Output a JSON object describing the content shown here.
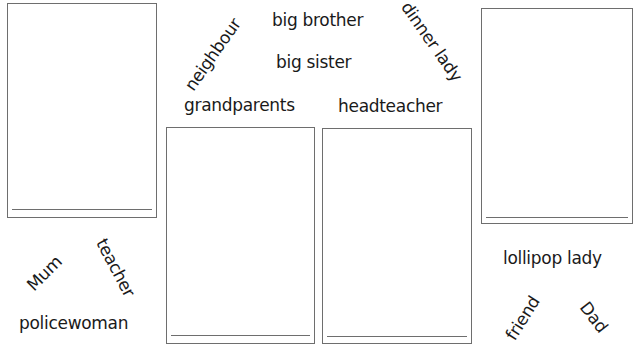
{
  "words": {
    "neighbour": "neighbour",
    "big_brother": "big brother",
    "big_sister": "big sister",
    "dinner_lady": "dinner lady",
    "grandparents": "grandparents",
    "headteacher": "headteacher",
    "mum": "Mum",
    "teacher": "teacher",
    "policewoman": "policewoman",
    "lollipop_lady": "lollipop lady",
    "friend": "friend",
    "dad": "Dad"
  },
  "boxes": [
    {
      "id": "box-1"
    },
    {
      "id": "box-2"
    },
    {
      "id": "box-3"
    },
    {
      "id": "box-4"
    }
  ]
}
